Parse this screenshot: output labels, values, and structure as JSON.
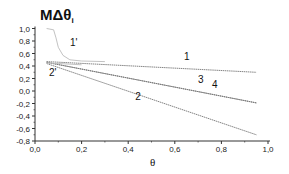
{
  "chart_data": {
    "type": "line",
    "title": "MΔθ",
    "title_subscript": "i",
    "xlabel": "θ",
    "ylabel": "MΔθi",
    "xlim": [
      0.0,
      1.0
    ],
    "ylim": [
      -0.8,
      1.0
    ],
    "x_ticks": [
      "0,0",
      "0,2",
      "0,4",
      "0,6",
      "0,8",
      "1,0"
    ],
    "y_ticks": [
      "1,0",
      "0,8",
      "0,6",
      "0,4",
      "0,2",
      "0,0",
      "-0,2",
      "-0,4",
      "-0,6",
      "-0,8"
    ],
    "grid": false,
    "legend": "inline labels",
    "series": [
      {
        "name": "1",
        "x": [
          0.05,
          0.95
        ],
        "values": [
          0.47,
          0.3
        ],
        "label_pos": [
          0.64,
          0.5
        ]
      },
      {
        "name": "3",
        "x": [
          0.05,
          0.95
        ],
        "values": [
          0.46,
          -0.19
        ],
        "label_pos": [
          0.7,
          0.13
        ]
      },
      {
        "name": "4",
        "x": [
          0.05,
          0.95
        ],
        "values": [
          0.46,
          -0.19
        ],
        "label_pos": [
          0.76,
          0.05
        ]
      },
      {
        "name": "2",
        "x": [
          0.05,
          0.95
        ],
        "values": [
          0.44,
          -0.7
        ],
        "label_pos": [
          0.43,
          -0.15
        ]
      },
      {
        "name": "1'",
        "x": [
          0.05,
          0.08,
          0.09,
          0.1,
          0.12,
          0.15,
          0.2,
          0.3
        ],
        "values": [
          1.0,
          0.98,
          0.85,
          0.7,
          0.57,
          0.5,
          0.48,
          0.47
        ],
        "label_pos": [
          0.15,
          0.72
        ]
      },
      {
        "name": "2'",
        "x": [
          0.05,
          0.1,
          0.2
        ],
        "values": [
          0.45,
          0.44,
          0.42
        ],
        "label_pos": [
          0.06,
          0.24
        ]
      }
    ]
  }
}
